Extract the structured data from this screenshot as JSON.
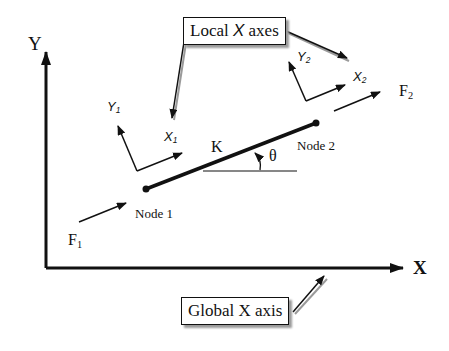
{
  "diagram": {
    "global_axes": {
      "y_label": "Y",
      "x_label": "X"
    },
    "callouts": {
      "local": {
        "prefix": "Local ",
        "italic_x": "X",
        "suffix": " axes"
      },
      "global": {
        "text": "Global X axis"
      }
    },
    "element": {
      "stiffness_label": "K",
      "angle_label": "θ"
    },
    "nodes": [
      {
        "label": "Node 1"
      },
      {
        "label": "Node 2"
      }
    ],
    "local_axes": [
      {
        "x_label": "X",
        "x_sub": "1",
        "y_label": "Y",
        "y_sub": "1"
      },
      {
        "x_label": "X",
        "x_sub": "2",
        "y_label": "Y",
        "y_sub": "2"
      }
    ],
    "forces": [
      {
        "label": "F",
        "sub": "1"
      },
      {
        "label": "F",
        "sub": "2"
      }
    ],
    "colors": {
      "line": "#111111",
      "shadow": "#9a9a9a",
      "background": "#ffffff"
    }
  }
}
